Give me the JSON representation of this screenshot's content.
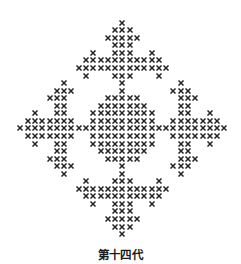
{
  "figure": {
    "caption": "第十四代",
    "mark_glyph": "cross-mark",
    "mark_color": "#222222",
    "grid": {
      "columns": 29,
      "rows": 29,
      "origin_x": 122.4,
      "origin_y": 22.7,
      "col_step": 7.29,
      "row_step": 7.55,
      "center_col_index": 14
    },
    "pattern_rows": [
      "..............x..............",
      ".............xxx.............",
      "............xxxxx............",
      ".............xxx.............",
      "..........x..xxx..x..........",
      ".........xxxxxxxxxxx.........",
      "........xxxxxxxxxxxxx........",
      ".........x...xxx...x.........",
      "......x.......x.......x......",
      ".....xxx......x......xxx.....",
      "....xxx.....xxxxx.....xxx....",
      ".....xx....xxxxxxx....xx.....",
      "..x..xx...xxxxxxxxx...xx..x..",
      ".xxxxxxx..xxxxxxxxx..xxxxxxx.",
      "xxxxxxxxxxxxxxxxxxxxxxxxxxxxx",
      ".xxxxxxx..xxxxxxxxx..xxxxxxx.",
      "..x..xx...xxxxxxxxx...xx..x..",
      ".....xx....xxxxxxx....xx.....",
      "....xxx.....xxxxx.....xxx....",
      ".....xxx......x......xxx.....",
      "......x.......x.......x......",
      ".........x...xxx...x.........",
      "........xxxxxxxxxxxxx........",
      ".........xxxxxxxxxxx.........",
      "..........x..xxx..x..........",
      ".............xxx.............",
      "............xxxxx............",
      ".............xxx.............",
      "..............x.............."
    ]
  }
}
